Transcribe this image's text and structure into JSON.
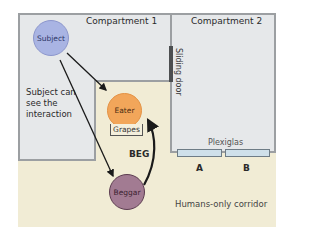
{
  "diagram": {
    "compartments": [
      {
        "id": "compartment-1",
        "label": "Compartment 1"
      },
      {
        "id": "compartment-2",
        "label": "Compartment 2"
      }
    ],
    "sliding_door_label": "Sliding door",
    "subject_note": [
      "Subject can",
      "see the",
      "interaction"
    ],
    "nodes": {
      "subject": "Subject",
      "eater": "Eater",
      "beggar": "Beggar",
      "grapes": "Grapes"
    },
    "beg_label": "BEG",
    "plexiglas_label": "Plexiglas",
    "windows": [
      "A",
      "B"
    ],
    "corridor_label": "Humans-only corridor",
    "colors": {
      "subject": "#a9b4e3",
      "eater": "#f2a65a",
      "beggar": "#a27b92",
      "compartment": "#e6e8ea",
      "corridor": "#f1ecd5",
      "plexiglas": "#cfe0ea",
      "door": "#4d4f51"
    },
    "edges": [
      {
        "from": "Subject",
        "to": "Eater"
      },
      {
        "from": "Subject",
        "to": "Beggar"
      },
      {
        "from": "Beggar",
        "to": "Eater",
        "label": "BEG"
      }
    ]
  }
}
